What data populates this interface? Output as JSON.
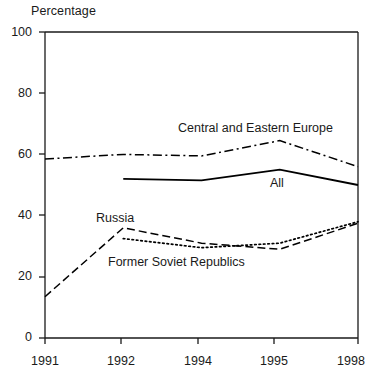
{
  "chart_data": {
    "type": "line",
    "title": "",
    "ylabel": "Percentage",
    "xlabel": "",
    "ylim": [
      0,
      100
    ],
    "yticks": [
      0,
      20,
      40,
      60,
      80,
      100
    ],
    "grid": false,
    "legend_position": "inline-annotations",
    "categories": [
      "1991",
      "1992",
      "1994",
      "1995",
      "1998"
    ],
    "series": [
      {
        "name": "Central and Eastern Europe",
        "style": "dash-dot",
        "color": "#000000",
        "x": [
          "1991",
          "1992",
          "1994",
          "1995",
          "1998"
        ],
        "values": [
          58.5,
          60,
          59.5,
          64.5,
          56
        ]
      },
      {
        "name": "All",
        "style": "solid",
        "color": "#000000",
        "x": [
          "1992",
          "1994",
          "1995",
          "1998"
        ],
        "values": [
          52,
          51.5,
          55,
          50
        ]
      },
      {
        "name": "Russia",
        "style": "dashed",
        "color": "#000000",
        "x": [
          "1991",
          "1992",
          "1994",
          "1995",
          "1998"
        ],
        "values": [
          13.5,
          36,
          31,
          29,
          37.5
        ]
      },
      {
        "name": "Former Soviet Republics",
        "style": "dotted",
        "color": "#000000",
        "x": [
          "1992",
          "1994",
          "1995",
          "1998"
        ],
        "values": [
          32.5,
          29.5,
          31,
          38
        ]
      }
    ],
    "annotations": [
      {
        "text": "Central and Eastern Europe",
        "series": "Central and Eastern Europe"
      },
      {
        "text": "All",
        "series": "All"
      },
      {
        "text": "Russia",
        "series": "Russia"
      },
      {
        "text": "Former Soviet Republics",
        "series": "Former Soviet Republics"
      }
    ]
  },
  "axis": {
    "y_title": "Percentage",
    "y_ticks": [
      "100",
      "80",
      "60",
      "40",
      "20",
      "0"
    ],
    "x_ticks": [
      "1991",
      "1992",
      "1994",
      "1995",
      "1998"
    ]
  },
  "labels": {
    "cee": "Central and Eastern Europe",
    "all": "All",
    "russia": "Russia",
    "fsr": "Former Soviet Republics"
  }
}
